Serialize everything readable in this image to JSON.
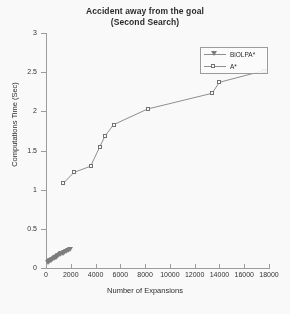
{
  "chart_data": {
    "type": "line",
    "title": "Accident away from the goal",
    "subtitle": "(Second Search)",
    "xlabel": "Number of Expansions",
    "ylabel": "Computations Time (Sec)",
    "xlim": [
      0,
      18000
    ],
    "ylim": [
      0,
      3
    ],
    "xticks": [
      0,
      2000,
      4000,
      6000,
      8000,
      10000,
      12000,
      14000,
      16000,
      18000
    ],
    "yticks": [
      0,
      0.5,
      1,
      1.5,
      2,
      2.5,
      3
    ],
    "xtick_labels": [
      "0",
      "2000",
      "4000",
      "6000",
      "8000",
      "10000",
      "12000",
      "14000",
      "16000",
      "18000"
    ],
    "ytick_labels": [
      "0",
      "0.5",
      "1",
      "1.5",
      "2",
      "2.5",
      "3"
    ],
    "grid": false,
    "legend_position": "top-right",
    "series": [
      {
        "name": "BiOLPA*",
        "marker": "triangle-down",
        "color": "#7a7a7a",
        "points": [
          {
            "x": 120,
            "y": 0.07
          },
          {
            "x": 250,
            "y": 0.08
          },
          {
            "x": 360,
            "y": 0.09
          },
          {
            "x": 430,
            "y": 0.1
          },
          {
            "x": 520,
            "y": 0.11
          },
          {
            "x": 610,
            "y": 0.12
          },
          {
            "x": 700,
            "y": 0.13
          },
          {
            "x": 800,
            "y": 0.14
          },
          {
            "x": 900,
            "y": 0.15
          },
          {
            "x": 1000,
            "y": 0.16
          },
          {
            "x": 1100,
            "y": 0.17
          },
          {
            "x": 1220,
            "y": 0.18
          },
          {
            "x": 1350,
            "y": 0.19
          },
          {
            "x": 1480,
            "y": 0.2
          },
          {
            "x": 1600,
            "y": 0.21
          },
          {
            "x": 1750,
            "y": 0.22
          },
          {
            "x": 1900,
            "y": 0.23
          }
        ]
      },
      {
        "name": "A*",
        "marker": "square",
        "color": "#6f6f6f",
        "points": [
          {
            "x": 1400,
            "y": 1.08
          },
          {
            "x": 2250,
            "y": 1.22
          },
          {
            "x": 3600,
            "y": 1.3
          },
          {
            "x": 4350,
            "y": 1.55
          },
          {
            "x": 4750,
            "y": 1.68
          },
          {
            "x": 5450,
            "y": 1.83
          },
          {
            "x": 8200,
            "y": 2.03
          },
          {
            "x": 13400,
            "y": 2.23
          },
          {
            "x": 14000,
            "y": 2.37
          },
          {
            "x": 17600,
            "y": 2.52
          }
        ]
      }
    ]
  },
  "legend": {
    "items": [
      {
        "label": "BiOLPA*"
      },
      {
        "label": "A*"
      }
    ]
  }
}
